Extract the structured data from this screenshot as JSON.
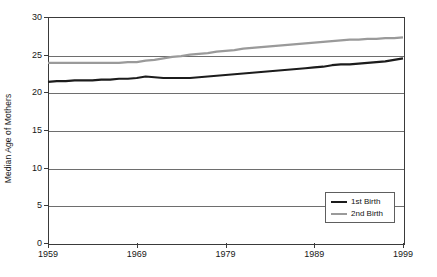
{
  "chart_data": {
    "type": "line",
    "title": "",
    "xlabel": "",
    "ylabel": "Median Age of Mothers",
    "xlim": [
      1959,
      1999
    ],
    "ylim": [
      0,
      30
    ],
    "ytick_labels": [
      "0",
      "5",
      "10",
      "15",
      "20",
      "25",
      "30"
    ],
    "yticks": [
      0,
      5,
      10,
      15,
      20,
      25,
      30
    ],
    "xtick_labels": [
      "1959",
      "1969",
      "1979",
      "1989",
      "1999"
    ],
    "xticks": [
      1959,
      1969,
      1979,
      1989,
      1999
    ],
    "grid": "horizontal",
    "legend_position": "inside-bottom-right",
    "x": [
      1959,
      1960,
      1961,
      1962,
      1963,
      1964,
      1965,
      1966,
      1967,
      1968,
      1969,
      1970,
      1971,
      1972,
      1973,
      1974,
      1975,
      1976,
      1977,
      1978,
      1979,
      1980,
      1981,
      1982,
      1983,
      1984,
      1985,
      1986,
      1987,
      1988,
      1989,
      1990,
      1991,
      1992,
      1993,
      1994,
      1995,
      1996,
      1997,
      1998,
      1999
    ],
    "series": [
      {
        "name": "1st Birth",
        "color": "#1c1c1c",
        "values": [
          21.4,
          21.5,
          21.5,
          21.6,
          21.6,
          21.6,
          21.7,
          21.7,
          21.8,
          21.8,
          21.9,
          22.1,
          22.0,
          21.9,
          21.9,
          21.9,
          21.9,
          22.0,
          22.1,
          22.2,
          22.3,
          22.4,
          22.5,
          22.6,
          22.7,
          22.8,
          22.9,
          23.0,
          23.1,
          23.2,
          23.3,
          23.4,
          23.6,
          23.7,
          23.7,
          23.8,
          23.9,
          24.0,
          24.1,
          24.3,
          24.5
        ]
      },
      {
        "name": "2nd Birth",
        "color": "#9a9a9a",
        "values": [
          23.9,
          23.9,
          23.9,
          23.9,
          23.9,
          23.9,
          23.9,
          23.9,
          23.9,
          24.0,
          24.0,
          24.2,
          24.3,
          24.5,
          24.7,
          24.8,
          25.0,
          25.1,
          25.2,
          25.4,
          25.5,
          25.6,
          25.8,
          25.9,
          26.0,
          26.1,
          26.2,
          26.3,
          26.4,
          26.5,
          26.6,
          26.7,
          26.8,
          26.9,
          27.0,
          27.0,
          27.1,
          27.1,
          27.2,
          27.2,
          27.3
        ]
      }
    ]
  },
  "legend": {
    "items": [
      {
        "label": "1st Birth"
      },
      {
        "label": "2nd Birth"
      }
    ]
  }
}
